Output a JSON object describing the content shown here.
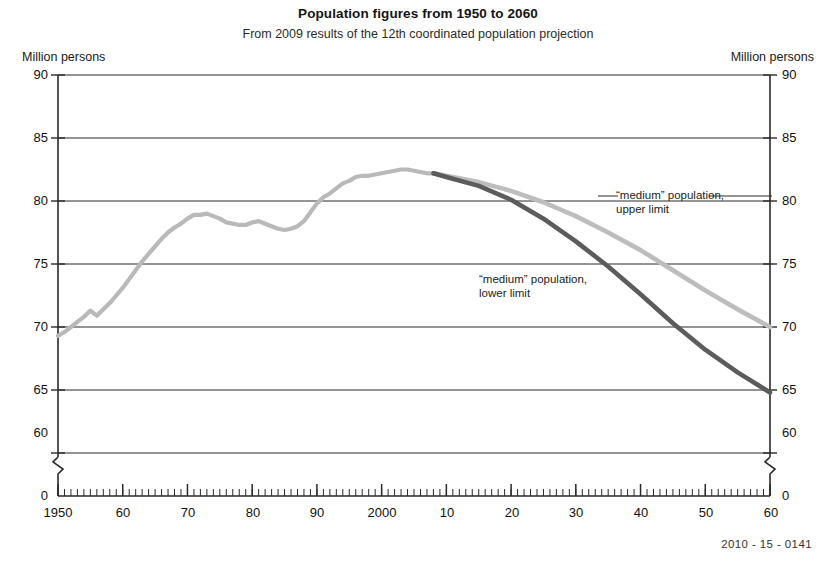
{
  "header": {
    "title": "Population figures from 1950 to 2060",
    "subtitle": "From 2009 results of the 12th coordinated population projection"
  },
  "axis": {
    "unit_left": "Million persons",
    "unit_right": "Million persons",
    "y_ticks": [
      "90",
      "85",
      "80",
      "75",
      "70",
      "65",
      "60",
      "0"
    ],
    "x_ticks": [
      "1950",
      "60",
      "70",
      "80",
      "90",
      "2000",
      "10",
      "20",
      "30",
      "40",
      "50",
      "60"
    ]
  },
  "annotations": {
    "upper": {
      "line1": "“medium” population,",
      "line2": "upper limit"
    },
    "lower": {
      "line1": "“medium” population,",
      "line2": "lower limit"
    }
  },
  "footer": {
    "code": "2010 - 15 - 0141"
  },
  "colors": {
    "historical": "#b9b9b9",
    "upper_limit": "#bdbdbd",
    "lower_limit": "#5c5c5c",
    "axis": "#2a2a2a",
    "grid": "#2a2a2a"
  },
  "chart_data": {
    "type": "line",
    "title": "Population figures from 1950 to 2060",
    "subtitle": "From 2009 results of the 12th coordinated population projection",
    "xlabel": "",
    "ylabel": "Million persons",
    "xlim": [
      1950,
      2060
    ],
    "ylim": [
      60,
      90
    ],
    "y_axis_break_below": 60,
    "grid": true,
    "legend": "annotations-inline",
    "x_tick_values": [
      1950,
      1960,
      1970,
      1980,
      1990,
      2000,
      2010,
      2020,
      2030,
      2040,
      2050,
      2060
    ],
    "x_tick_labels": [
      "1950",
      "60",
      "70",
      "80",
      "90",
      "2000",
      "10",
      "20",
      "30",
      "40",
      "50",
      "60"
    ],
    "y_tick_values": [
      60,
      65,
      70,
      75,
      80,
      85,
      90
    ],
    "minor_x_tick_interval": 1,
    "series": [
      {
        "name": "historical population",
        "color": "#b9b9b9",
        "x": [
          1950,
          1951,
          1952,
          1953,
          1954,
          1955,
          1956,
          1957,
          1958,
          1959,
          1960,
          1961,
          1962,
          1963,
          1964,
          1965,
          1966,
          1967,
          1968,
          1969,
          1970,
          1971,
          1972,
          1973,
          1974,
          1975,
          1976,
          1977,
          1978,
          1979,
          1980,
          1981,
          1982,
          1983,
          1984,
          1985,
          1986,
          1987,
          1988,
          1989,
          1990,
          1991,
          1992,
          1993,
          1994,
          1995,
          1996,
          1997,
          1998,
          1999,
          2000,
          2001,
          2002,
          2003,
          2004,
          2005,
          2006,
          2007,
          2008
        ],
        "values": [
          69.3,
          69.6,
          70.0,
          70.4,
          70.8,
          71.3,
          70.9,
          71.4,
          71.9,
          72.5,
          73.1,
          73.8,
          74.5,
          75.2,
          75.8,
          76.4,
          77.0,
          77.5,
          77.9,
          78.2,
          78.6,
          78.9,
          78.9,
          79.0,
          78.8,
          78.6,
          78.3,
          78.2,
          78.1,
          78.1,
          78.3,
          78.4,
          78.2,
          78.0,
          77.8,
          77.7,
          77.8,
          78.0,
          78.4,
          79.1,
          79.8,
          80.3,
          80.6,
          81.0,
          81.4,
          81.6,
          81.9,
          82.0,
          82.0,
          82.1,
          82.2,
          82.3,
          82.4,
          82.5,
          82.5,
          82.4,
          82.3,
          82.2,
          82.2
        ]
      },
      {
        "name": "“medium” population, upper limit",
        "color": "#bdbdbd",
        "x": [
          2008,
          2010,
          2015,
          2020,
          2025,
          2030,
          2035,
          2040,
          2045,
          2050,
          2055,
          2060
        ],
        "values": [
          82.2,
          82.0,
          81.5,
          80.8,
          79.9,
          78.8,
          77.5,
          76.1,
          74.5,
          72.9,
          71.4,
          70.0
        ]
      },
      {
        "name": "“medium” population, lower limit",
        "color": "#5c5c5c",
        "x": [
          2008,
          2010,
          2015,
          2020,
          2025,
          2030,
          2035,
          2040,
          2045,
          2050,
          2055,
          2060
        ],
        "values": [
          82.2,
          81.9,
          81.2,
          80.1,
          78.6,
          76.8,
          74.8,
          72.6,
          70.3,
          68.2,
          66.4,
          64.8
        ]
      }
    ],
    "annotations": [
      {
        "text": "“medium” population, upper limit",
        "target_series": "upper limit",
        "target_x": 2032
      },
      {
        "text": "“medium” population, lower limit",
        "target_series": "lower limit",
        "target_x": 2038
      }
    ]
  }
}
